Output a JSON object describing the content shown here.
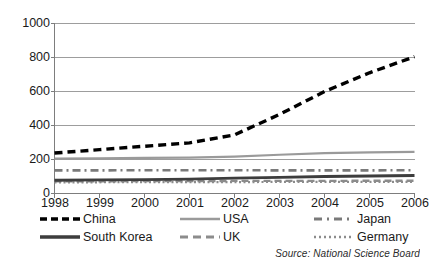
{
  "chart_data": {
    "type": "line",
    "title": "",
    "subtitle": "",
    "xlabel": "",
    "ylabel": "",
    "x": [
      1998,
      1999,
      2000,
      2001,
      2002,
      2003,
      2004,
      2005,
      2006
    ],
    "categories": [
      "1998",
      "1999",
      "2000",
      "2001",
      "2002",
      "2003",
      "2004",
      "2005",
      "2006"
    ],
    "xlim": [
      1998,
      2006
    ],
    "ylim": [
      0,
      1000
    ],
    "ytick_labels": [
      "1000",
      "800",
      "600",
      "400",
      "200",
      "0"
    ],
    "ytick_values": [
      1000,
      800,
      600,
      400,
      200,
      0
    ],
    "grid": "horizontal",
    "legend_position": "bottom",
    "series": [
      {
        "name": "China",
        "style": "thick-dashed",
        "color": "#000000",
        "values": [
          238,
          258,
          278,
          298,
          345,
          465,
          600,
          710,
          805
        ]
      },
      {
        "name": "USA",
        "style": "solid",
        "color": "#9a9a9a",
        "values": [
          205,
          207,
          209,
          211,
          217,
          228,
          238,
          242,
          245
        ]
      },
      {
        "name": "Japan",
        "style": "dash-dot",
        "color": "#7a7a7a",
        "values": [
          136,
          136,
          137,
          137,
          137,
          136,
          136,
          136,
          137
        ]
      },
      {
        "name": "South Korea",
        "style": "thick-solid",
        "color": "#3d3d3d",
        "values": [
          78,
          80,
          82,
          85,
          90,
          95,
          100,
          103,
          106
        ]
      },
      {
        "name": "UK",
        "style": "dashed",
        "color": "#8c8c8c",
        "values": [
          72,
          72,
          73,
          73,
          74,
          74,
          74,
          75,
          75
        ]
      },
      {
        "name": "Germany",
        "style": "dotted",
        "color": "#8c8c8c",
        "values": [
          66,
          66,
          67,
          67,
          67,
          68,
          68,
          68,
          69
        ]
      }
    ],
    "annotations": [
      {
        "name": "source",
        "text": "Source: National Science Board"
      }
    ]
  },
  "axes": {
    "y_ticks": [
      {
        "label": "1000",
        "value": 1000
      },
      {
        "label": "800",
        "value": 800
      },
      {
        "label": "600",
        "value": 600
      },
      {
        "label": "400",
        "value": 400
      },
      {
        "label": "200",
        "value": 200
      },
      {
        "label": "0",
        "value": 0
      }
    ],
    "x_ticks": [
      {
        "label": "1998"
      },
      {
        "label": "1999"
      },
      {
        "label": "2000"
      },
      {
        "label": "2001"
      },
      {
        "label": "2002"
      },
      {
        "label": "2003"
      },
      {
        "label": "2004"
      },
      {
        "label": "2005"
      },
      {
        "label": "2006"
      }
    ]
  },
  "legend": {
    "entries": [
      {
        "label": "China",
        "style": "thick-dashed",
        "color": "#000000"
      },
      {
        "label": "USA",
        "style": "solid",
        "color": "#9a9a9a"
      },
      {
        "label": "Japan",
        "style": "dash-dot",
        "color": "#7a7a7a"
      },
      {
        "label": "South Korea",
        "style": "thick-solid",
        "color": "#3d3d3d"
      },
      {
        "label": "UK",
        "style": "dashed",
        "color": "#8c8c8c"
      },
      {
        "label": "Germany",
        "style": "dotted",
        "color": "#8c8c8c"
      }
    ]
  },
  "source": {
    "text": "Source: National Science Board"
  },
  "colors": {
    "background": "#ffffff",
    "gridline": "#9d9d9d",
    "axis": "#7d7d7d",
    "text": "#1a1a1a"
  }
}
